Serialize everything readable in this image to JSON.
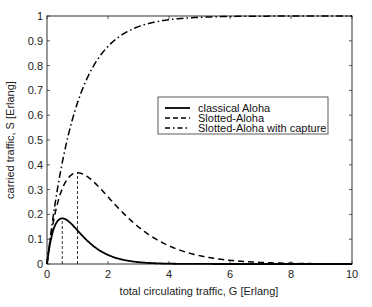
{
  "chart_data": {
    "type": "line",
    "title": "",
    "xlabel": "total circulating traffic, G  [Erlang]",
    "ylabel": "carried traffic, S [Erlang]",
    "xlim": [
      0,
      10
    ],
    "ylim": [
      0,
      1
    ],
    "xticks": [
      0,
      2,
      4,
      6,
      8,
      10
    ],
    "yticks": [
      0,
      0.1,
      0.2,
      0.3,
      0.4,
      0.5,
      0.6,
      0.7,
      0.8,
      0.9,
      1
    ],
    "grid": false,
    "legend_position": "center-right",
    "series": [
      {
        "name": "classical Aloha",
        "style": "solid",
        "formula": "S = G*exp(-2G)",
        "peak": {
          "G": 0.5,
          "S": 0.184
        }
      },
      {
        "name": "Slotted-Aloha",
        "style": "dashed",
        "formula": "S = G*exp(-G)",
        "peak": {
          "G": 1.0,
          "S": 0.368
        }
      },
      {
        "name": "Slotted-Aloha with capture",
        "style": "dashdot",
        "formula": "S ≈ 1 - exp(-G) (saturates to 1)"
      }
    ],
    "annotations": [
      {
        "type": "vline",
        "x": 0.5,
        "y_to": 0.184,
        "style": "dashed"
      },
      {
        "type": "vline",
        "x": 1.0,
        "y_to": 0.368,
        "style": "dashed"
      }
    ],
    "sample_points": {
      "x": [
        0,
        0.5,
        1,
        1.5,
        2,
        3,
        4,
        5,
        6,
        8,
        10
      ],
      "classical_aloha": [
        0,
        0.184,
        0.135,
        0.075,
        0.037,
        0.007,
        0.001,
        0.0,
        0.0,
        0.0,
        0.0
      ],
      "slotted_aloha": [
        0,
        0.303,
        0.368,
        0.335,
        0.271,
        0.149,
        0.073,
        0.034,
        0.015,
        0.003,
        0.0
      ],
      "slotted_aloha_capture": [
        0,
        0.39,
        0.63,
        0.78,
        0.86,
        0.95,
        0.98,
        0.99,
        1.0,
        1.0,
        1.0
      ]
    }
  }
}
